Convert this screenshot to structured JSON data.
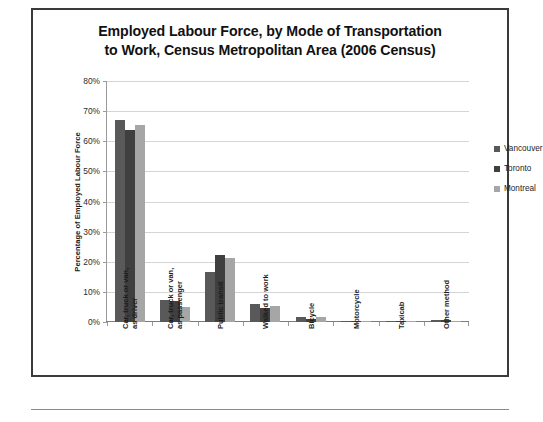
{
  "chart_data": {
    "type": "bar",
    "title": "Employed Labour Force, by Mode of Transportation to Work, Census Metropolitan Area (2006 Census)",
    "title_lines": [
      "Employed Labour Force, by Mode of Transportation",
      "to Work, Census Metropolitan Area (2006 Census)"
    ],
    "xlabel": "",
    "ylabel": "Percentage of Employed Labour Force",
    "ylim": [
      0,
      80
    ],
    "ytick_labels": [
      "80%",
      "70%",
      "60%",
      "50%",
      "40%",
      "30%",
      "20%",
      "10%",
      "0%"
    ],
    "ytick_values": [
      80,
      70,
      60,
      50,
      40,
      30,
      20,
      10,
      0
    ],
    "grid": true,
    "legend_position": "right",
    "categories": [
      "Car, truck or van, as driver",
      "Car, truck or van, as passenger",
      "Public transit",
      "Walked to work",
      "Bicycle",
      "Motorcycle",
      "Taxicab",
      "Other method"
    ],
    "category_lines": [
      [
        "Car, truck or van,",
        "as driver"
      ],
      [
        "Car, truck or van,",
        "as passenger"
      ],
      [
        "Public transit"
      ],
      [
        "Walked to work"
      ],
      [
        "Bicycle"
      ],
      [
        "Motorcycle"
      ],
      [
        "Taxicab"
      ],
      [
        "Other method"
      ]
    ],
    "series": [
      {
        "name": "Vancouver",
        "color": "#595959",
        "values": [
          67.0,
          7.2,
          16.5,
          6.1,
          1.7,
          0.1,
          0.2,
          0.6
        ]
      },
      {
        "name": "Toronto",
        "color": "#3f3f3f",
        "values": [
          63.6,
          7.1,
          22.2,
          4.6,
          1.0,
          0.1,
          0.3,
          0.6
        ]
      },
      {
        "name": "Montreal",
        "color": "#a6a6a6",
        "values": [
          65.5,
          5.1,
          21.4,
          5.4,
          1.5,
          0.1,
          0.2,
          0.5
        ]
      }
    ]
  },
  "colors": {
    "frame_border": "#3a3a3a",
    "gridline": "#d4d4d4",
    "axis": "#9a9a9a",
    "title_text": "#111111",
    "background": "#ffffff"
  }
}
